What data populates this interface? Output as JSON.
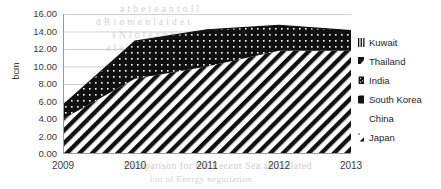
{
  "chart_data": {
    "type": "area",
    "stacked": true,
    "title": "",
    "xlabel": "",
    "ylabel": "bcm",
    "x": [
      2009,
      2010,
      2011,
      2012,
      2013
    ],
    "categories": [
      "2009",
      "2010",
      "2011",
      "2012",
      "2013"
    ],
    "xtick_labels": [
      "2009",
      "2010",
      "2011",
      "2012",
      "2013"
    ],
    "ytick_labels": [
      "16.00",
      "14.00",
      "12.00",
      "10.00",
      "8.00",
      "6.00",
      "4.00",
      "2.00",
      "0.00"
    ],
    "ytick_values": [
      16.0,
      14.0,
      12.0,
      10.0,
      8.0,
      6.0,
      4.0,
      2.0,
      0.0
    ],
    "ylim": [
      0.0,
      16.0
    ],
    "ytick_step": 2.0,
    "grid": true,
    "grid_axis": "y",
    "legend_position": "right",
    "series": [
      {
        "name": "Japan",
        "pattern": "diagonal-hatch",
        "values": [
          4.0,
          8.6,
          10.0,
          11.8,
          11.8
        ]
      },
      {
        "name": "China",
        "pattern": "blank",
        "values": [
          0.0,
          0.0,
          0.0,
          0.0,
          0.0
        ]
      },
      {
        "name": "South Korea",
        "pattern": "dotted-fill",
        "values": [
          1.6,
          4.3,
          4.2,
          2.9,
          2.3
        ]
      },
      {
        "name": "India",
        "pattern": "dotted-fill",
        "values": [
          0.0,
          0.0,
          0.0,
          0.0,
          0.0
        ]
      },
      {
        "name": "Thailand",
        "pattern": "dark-fill",
        "values": [
          0.0,
          0.0,
          0.0,
          0.0,
          0.0
        ]
      },
      {
        "name": "Kuwait",
        "pattern": "striped",
        "values": [
          0.0,
          0.0,
          0.0,
          0.0,
          0.0
        ]
      }
    ],
    "stack_totals": [
      5.6,
      12.9,
      14.2,
      14.7,
      14.1
    ],
    "series_order_bottom_to_top": [
      "Japan",
      "China",
      "South Korea",
      "India",
      "Thailand",
      "Kuwait"
    ]
  },
  "legend": {
    "items": [
      {
        "label": "Kuwait",
        "icon": "legend-swatch-striped-icon"
      },
      {
        "label": "Thailand",
        "icon": "legend-swatch-dark-icon"
      },
      {
        "label": "India",
        "icon": "legend-swatch-dotted-icon"
      },
      {
        "label": "South Korea",
        "icon": "legend-swatch-solid-icon"
      },
      {
        "label": "China",
        "icon": "legend-swatch-blank-icon"
      },
      {
        "label": "Japan",
        "icon": "legend-swatch-hatch-icon"
      }
    ]
  },
  "bleed_text": {
    "line1": "a  t  h  e  i  e  a  n  t  o  l  l",
    "line2": "d  R  i  o  m  e  n  l  a  i  d  e  t",
    "line3": "s  N  i  o  t  e  r  o  n  e  d",
    "line4": "a  l  e  i  s  l  a  r  g  e  o",
    "line5": "t  a  n  h  e  s  e  n  o  r  e",
    "line6": "Comparison  for  the  Recent  Sea  and  related",
    "line7": "ion of Energy negotiation"
  },
  "colors": {
    "ink": "#1a1a1a",
    "axis": "#9a9a9a",
    "grid": "#cfcfcf",
    "text": "#3a3a3a",
    "background": "#ffffff",
    "bleed": "#d2d0cd"
  }
}
